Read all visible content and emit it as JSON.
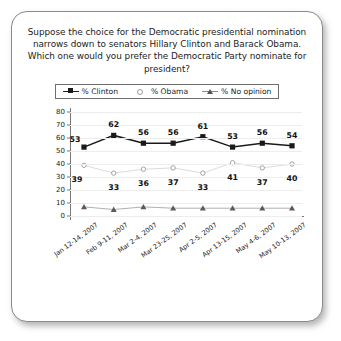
{
  "card": {
    "question": "Suppose the choice for the Democratic presidential nomination narrows down to senators Hillary Clinton and Barack Obama. Which one would you prefer the Democratic Party nominate for president?"
  },
  "legend": {
    "items": [
      {
        "label": "% Clinton",
        "icon": "filled-square-marker",
        "color": "#1a1a1a"
      },
      {
        "label": "% Obama",
        "icon": "open-circle-marker",
        "color": "#9a9a9a"
      },
      {
        "label": "% No opinion",
        "icon": "filled-triangle-marker",
        "color": "#555555"
      }
    ]
  },
  "chart_data": {
    "type": "line",
    "title": "",
    "xlabel": "",
    "ylabel": "",
    "ylim": [
      0,
      80
    ],
    "yticks": [
      0,
      10,
      20,
      30,
      40,
      50,
      60,
      70,
      80
    ],
    "grid": true,
    "legend_position": "top",
    "categories": [
      "Jan 12-14, 2007",
      "Feb 9-11, 2007",
      "Mar 2-4, 2007",
      "Mar 23-25, 2007",
      "Apr 2-5, 2007",
      "Apr 13-15, 2007",
      "May 4-6, 2007",
      "May 10-13, 2007"
    ],
    "series": [
      {
        "name": "% Clinton",
        "color": "#1a1a1a",
        "marker": "square",
        "labels_shown": true,
        "values": [
          53,
          62,
          56,
          56,
          61,
          53,
          56,
          54
        ]
      },
      {
        "name": "% Obama",
        "color": "#9a9a9a",
        "marker": "circle",
        "labels_shown": true,
        "values": [
          39,
          33,
          36,
          37,
          33,
          41,
          37,
          40
        ]
      },
      {
        "name": "% No opinion",
        "color": "#6a6a6a",
        "marker": "triangle",
        "labels_shown": false,
        "values": [
          7,
          5,
          7,
          6,
          6,
          6,
          6,
          6
        ]
      }
    ]
  }
}
